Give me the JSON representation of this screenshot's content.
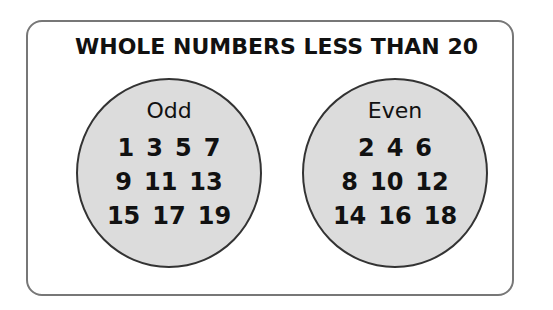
{
  "title": "WHOLE NUMBERS LESS THAN 20",
  "sets": [
    {
      "label": "Odd",
      "rows": [
        [
          "1",
          "3",
          "5",
          "7"
        ],
        [
          "9",
          "11",
          "13"
        ],
        [
          "15",
          "17",
          "19"
        ]
      ]
    },
    {
      "label": "Even",
      "rows": [
        [
          "2",
          "4",
          "6"
        ],
        [
          "8",
          "10",
          "12"
        ],
        [
          "14",
          "16",
          "18"
        ]
      ]
    }
  ],
  "colors": {
    "circle_fill": "#dcdcdc",
    "circle_border": "#333333",
    "frame_border": "#777777"
  }
}
